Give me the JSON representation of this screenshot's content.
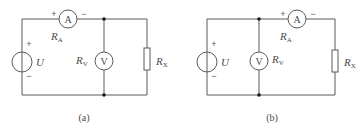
{
  "figure": {
    "panels": [
      {
        "id": "a",
        "caption": "(a)",
        "source": {
          "label": "U",
          "plus": "+",
          "minus": "−"
        },
        "ammeter": {
          "symbol": "A",
          "label": "R",
          "label_sub": "A",
          "plus": "+",
          "minus": "−"
        },
        "voltmeter": {
          "symbol": "V",
          "label": "R",
          "label_sub": "V"
        },
        "resistor": {
          "label": "R",
          "label_sub": "X"
        }
      },
      {
        "id": "b",
        "caption": "(b)",
        "source": {
          "label": "U",
          "plus": "+",
          "minus": "−"
        },
        "ammeter": {
          "symbol": "A",
          "label": "R",
          "label_sub": "A",
          "plus": "+",
          "minus": "−"
        },
        "voltmeter": {
          "symbol": "V",
          "label": "R",
          "label_sub": "V"
        },
        "resistor": {
          "label": "R",
          "label_sub": "X"
        }
      }
    ],
    "colors": {
      "wire": "#5a5a5a",
      "node": "#1a1a1a",
      "text": "#4a4a4a",
      "background": "#ffffff"
    }
  }
}
